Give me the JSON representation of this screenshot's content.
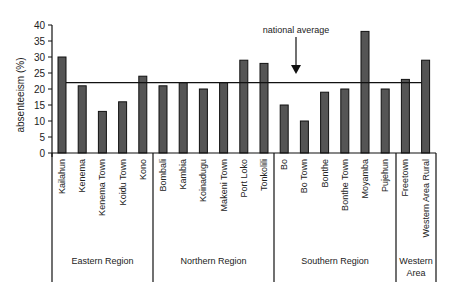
{
  "chart_data": {
    "type": "bar",
    "title": "",
    "xlabel": "",
    "ylabel": "absenteeism (%)",
    "ylim": [
      0,
      40
    ],
    "yticks": [
      0,
      5,
      10,
      15,
      20,
      25,
      30,
      35,
      40
    ],
    "grid": false,
    "legend": null,
    "categories": [
      "Kailahun",
      "Kenema",
      "Kenema Town",
      "Koidu Town",
      "Kono",
      "Bombali",
      "Kambia",
      "Koinadugu",
      "Makeni Town",
      "Port Loko",
      "Tonkolili",
      "Bo",
      "Bo Town",
      "Bonthe",
      "Bonthe Town",
      "Moyamba",
      "Pujehun",
      "Freetown",
      "Western Area Rural"
    ],
    "values": [
      30,
      21,
      13,
      16,
      24,
      21,
      22,
      20,
      22,
      29,
      28,
      15,
      10,
      19,
      20,
      38,
      20,
      23,
      29
    ],
    "groups": [
      {
        "label": "Eastern Region",
        "start": 0,
        "end": 4
      },
      {
        "label": "Northern Region",
        "start": 5,
        "end": 10
      },
      {
        "label": "Southern Region",
        "start": 11,
        "end": 16
      },
      {
        "label": "Western Area",
        "start": 17,
        "end": 18
      }
    ],
    "reference_line": {
      "label": "national average",
      "value": 22
    },
    "colors": {
      "bar_fill": "#555555",
      "bar_stroke": "#111111",
      "axis": "#111111"
    }
  }
}
